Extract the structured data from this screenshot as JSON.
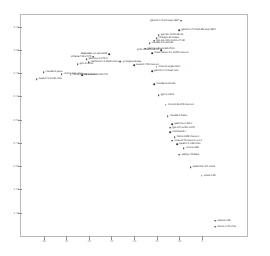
{
  "chart_data": {
    "type": "scatter",
    "title": "",
    "xlabel": "",
    "ylabel": "",
    "xlim": [
      -45,
      5
    ],
    "ylim": [
      -1.55,
      0.35
    ],
    "grid": false,
    "legend": null,
    "xticks": [
      -40,
      -35,
      -30,
      -25,
      -20,
      -15,
      -10,
      -5
    ],
    "xticklabels": [
      "-40",
      "-35",
      "-30",
      "-25",
      "-20",
      "-15",
      "-10",
      "-5"
    ],
    "yticks": [
      0.25,
      0.05,
      -0.15,
      -0.35,
      -0.55,
      -0.75,
      -0.95,
      -1.15,
      -1.35
    ],
    "yticklabels": [
      "0.25",
      "0.05",
      "-0.15",
      "-0.35",
      "-0.55",
      "-0.75",
      "-0.95",
      "-1.15",
      "-1.35"
    ],
    "points": [
      {
        "label": "gemini-1.5-pro-exp-0827",
        "x": -9.5,
        "y": 0.3,
        "align": "left"
      },
      {
        "label": "gemini-1.5-flash-8b-exp-0827",
        "x": -10.0,
        "y": 0.22,
        "align": "right"
      },
      {
        "label": "gpt-4o-2024-08-06",
        "x": -14.5,
        "y": 0.175,
        "align": "right"
      },
      {
        "label": "chatgpt-4o-latest",
        "x": -15.0,
        "y": 0.15,
        "align": "right"
      },
      {
        "label": "gpt-4o-mini-2024-07-18",
        "x": -15.5,
        "y": 0.13,
        "align": "right"
      },
      {
        "label": "claude-3-5-sonnet",
        "x": -16.5,
        "y": 0.105,
        "align": "right"
      },
      {
        "label": "gemini-advanced-0514",
        "x": -17.5,
        "y": 0.06,
        "align": "right"
      },
      {
        "label": "grok-2-2024-08-13",
        "x": -14.0,
        "y": 0.045,
        "align": "left"
      },
      {
        "label": "meta-llama-3.1-405b-instruct",
        "x": -16.0,
        "y": 0.02,
        "align": "right"
      },
      {
        "label": "deepseek-v2-api-0628",
        "x": -25.5,
        "y": 0.015,
        "align": "left"
      },
      {
        "label": "athene-70b-0725",
        "x": -29.0,
        "y": -0.01,
        "align": "left"
      },
      {
        "label": "gemma-2-27b-it",
        "x": -30.5,
        "y": -0.03,
        "align": "right"
      },
      {
        "label": "nemotron-4-340b-instruct",
        "x": -30.0,
        "y": -0.055,
        "align": "right"
      },
      {
        "label": "yi-large-preview",
        "x": -23.0,
        "y": -0.05,
        "align": "right"
      },
      {
        "label": "glm-4-0520",
        "x": -32.5,
        "y": -0.075,
        "align": "right"
      },
      {
        "label": "qwen2-72b-instruct",
        "x": -20.0,
        "y": -0.08,
        "align": "right"
      },
      {
        "label": "mistral-large-2407",
        "x": -15.0,
        "y": -0.095,
        "align": "right"
      },
      {
        "label": "gemini-1.5-flash-001",
        "x": -16.0,
        "y": -0.135,
        "align": "right"
      },
      {
        "label": "claude-3-opus",
        "x": -40.0,
        "y": -0.14,
        "align": "right"
      },
      {
        "label": "command-r-plus",
        "x": -36.0,
        "y": -0.16,
        "align": "right"
      },
      {
        "label": "llama-3-70b-instruct",
        "x": -34.0,
        "y": -0.165,
        "align": "right"
      },
      {
        "label": "reka-core-20240722",
        "x": -31.5,
        "y": -0.17,
        "align": "right"
      },
      {
        "label": "qwen1.5-110b-chat",
        "x": -41.5,
        "y": -0.2,
        "align": "right"
      },
      {
        "label": "claude-3-sonnet",
        "x": -15.5,
        "y": -0.245,
        "align": "right"
      },
      {
        "label": "gpt-4-0613",
        "x": -14.5,
        "y": -0.34,
        "align": "right"
      },
      {
        "label": "mixtral-8x22b-instruct",
        "x": -13.0,
        "y": -0.42,
        "align": "right"
      },
      {
        "label": "claude-3-haiku",
        "x": -12.5,
        "y": -0.52,
        "align": "right"
      },
      {
        "label": "gemma-2-9b-it",
        "x": -11.5,
        "y": -0.59,
        "align": "right"
      },
      {
        "label": "gpt-3.5-turbo-0125",
        "x": -12.0,
        "y": -0.62,
        "align": "right"
      },
      {
        "label": "command-r",
        "x": -12.0,
        "y": -0.66,
        "align": "right"
      },
      {
        "label": "llama-3-8b-instruct",
        "x": -11.0,
        "y": -0.7,
        "align": "right"
      },
      {
        "label": "mistral-7b-instruct-v0.2",
        "x": -11.5,
        "y": -0.73,
        "align": "right"
      },
      {
        "label": "qwen1.5-14b-chat",
        "x": -10.5,
        "y": -0.76,
        "align": "right"
      },
      {
        "label": "vicuna-33b",
        "x": -9.0,
        "y": -0.795,
        "align": "right"
      },
      {
        "label": "zephyr-7b-beta",
        "x": -10.0,
        "y": -0.85,
        "align": "right"
      },
      {
        "label": "openchat-3.5-0106",
        "x": -7.5,
        "y": -0.96,
        "align": "right"
      },
      {
        "label": "koala-13b",
        "x": -5.0,
        "y": -1.03,
        "align": "right"
      },
      {
        "label": "alpaca-13b",
        "x": -2.0,
        "y": -1.42,
        "align": "right"
      },
      {
        "label": "llama-2-7b-chat",
        "x": -2.0,
        "y": -1.47,
        "align": "right"
      }
    ]
  }
}
